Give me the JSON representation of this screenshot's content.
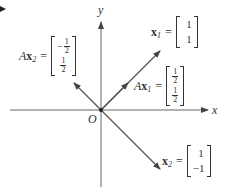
{
  "diagram": {
    "axes": {
      "x_label": "x",
      "y_label": "y",
      "origin_label": "O"
    },
    "vectors": [
      {
        "id": "x1",
        "label_prefix": "",
        "label_bold": "x",
        "label_sub": "1",
        "components": [
          "1",
          "1"
        ],
        "direction": "up-right"
      },
      {
        "id": "Ax1",
        "label_prefix": "A",
        "label_bold": "x",
        "label_sub": "1",
        "components": [
          "1/2",
          "1/2"
        ],
        "direction": "up-right"
      },
      {
        "id": "x2",
        "label_prefix": "",
        "label_bold": "x",
        "label_sub": "2",
        "components": [
          "1",
          "-1"
        ],
        "direction": "down-right"
      },
      {
        "id": "Ax2",
        "label_prefix": "A",
        "label_bold": "x",
        "label_sub": "2",
        "components": [
          "-1/2",
          "1/2"
        ],
        "direction": "up-left"
      }
    ],
    "equals": "=",
    "colors": {
      "line": "#555555",
      "text": "#333333",
      "background": "#ffffff"
    }
  }
}
